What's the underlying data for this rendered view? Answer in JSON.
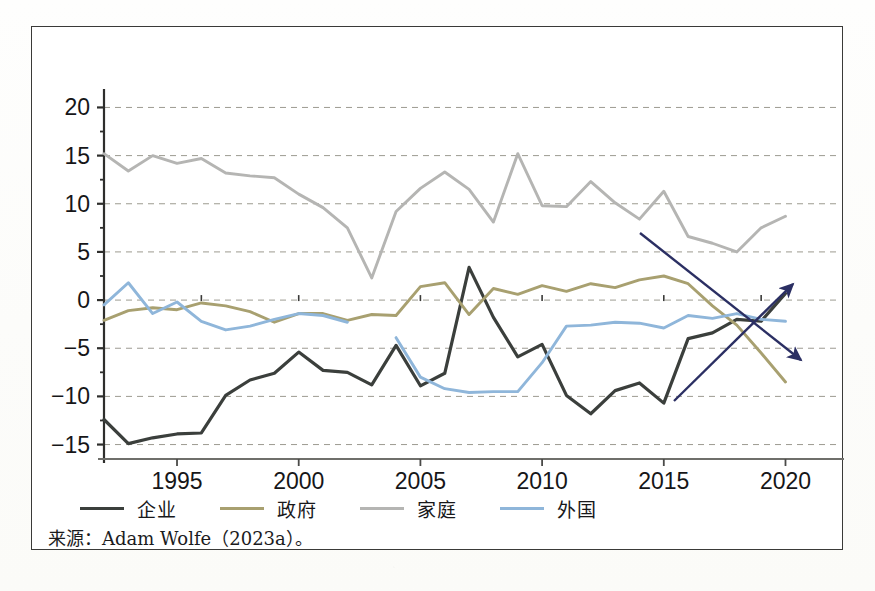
{
  "figure": {
    "source_note": "来源：Adam Wolfe（2023a）。",
    "frame_color": "#3a3a38",
    "background": "#ffffff"
  },
  "legend": {
    "position": "bottom-left",
    "items": [
      {
        "label": "企业",
        "color": "#3b3f3c",
        "name": "corporate"
      },
      {
        "label": "政府",
        "color": "#a8a070",
        "name": "government"
      },
      {
        "label": "家庭",
        "color": "#b5b5b3",
        "name": "household"
      },
      {
        "label": "外国",
        "color": "#8fb6da",
        "name": "foreign"
      }
    ]
  },
  "annotations": {
    "arrows": [
      {
        "name": "up-trend-arrow",
        "color": "#2b2f63",
        "x1": 673,
        "y1": 400,
        "x2": 792,
        "y2": 283
      },
      {
        "name": "down-trend-arrow",
        "color": "#2b2f63",
        "x1": 639,
        "y1": 232,
        "x2": 800,
        "y2": 359
      }
    ]
  },
  "chart_data": {
    "type": "line",
    "title": "",
    "xlabel": "",
    "ylabel": "",
    "xlim": [
      1992,
      2021.5
    ],
    "ylim": [
      -16.5,
      21.5
    ],
    "yticks": [
      -15,
      -10,
      -5,
      0,
      5,
      10,
      15,
      20
    ],
    "ytick_labels": [
      "-15",
      "-10",
      "-5",
      "0",
      "5",
      "10",
      "15",
      "20"
    ],
    "xticks": [
      1995,
      2000,
      2005,
      2010,
      2015,
      2020
    ],
    "xtick_labels": [
      "1995",
      "2000",
      "2005",
      "2010",
      "2015",
      "2020"
    ],
    "xminor_ticks": [
      1993,
      1994,
      1996,
      1997,
      1998,
      1999,
      2001,
      2002,
      2003,
      2004,
      2006,
      2007,
      2008,
      2009,
      2011,
      2012,
      2013,
      2014,
      2016,
      2017,
      2018,
      2019,
      2021
    ],
    "grid": "horizontal-dashed",
    "legend_position": "below-axes-left",
    "x": [
      1992,
      1993,
      1994,
      1995,
      1996,
      1997,
      1998,
      1999,
      2000,
      2001,
      2002,
      2003,
      2004,
      2005,
      2006,
      2007,
      2008,
      2009,
      2010,
      2011,
      2012,
      2013,
      2014,
      2015,
      2016,
      2017,
      2018,
      2019,
      2020
    ],
    "series": [
      {
        "name": "企业",
        "key": "corporate",
        "color": "#3b3f3c",
        "values": [
          -12.4,
          -14.9,
          -14.3,
          -13.9,
          -13.8,
          -9.9,
          -8.3,
          -7.6,
          -5.4,
          -7.3,
          -7.5,
          -8.8,
          -4.7,
          -8.9,
          -7.6,
          3.4,
          -1.8,
          -5.9,
          -4.6,
          -9.9,
          -11.8,
          -9.4,
          -8.6,
          -10.7,
          -4.0,
          -3.4,
          -2.0,
          -2.2,
          0.7
        ]
      },
      {
        "name": "政府",
        "key": "government",
        "color": "#a8a070",
        "values": [
          -2.1,
          -1.1,
          -0.8,
          -1.0,
          -0.3,
          -0.6,
          -1.2,
          -2.3,
          -1.4,
          -1.4,
          -2.1,
          -1.5,
          -1.6,
          1.4,
          1.8,
          -1.5,
          1.2,
          0.6,
          1.5,
          0.9,
          1.7,
          1.3,
          2.1,
          2.5,
          1.7,
          -0.6,
          -2.6,
          -5.5,
          -8.5
        ]
      },
      {
        "name": "家庭",
        "key": "household",
        "color": "#b5b5b3",
        "values": [
          15.2,
          13.4,
          15.0,
          14.2,
          14.7,
          13.2,
          12.9,
          12.7,
          11.0,
          9.6,
          7.5,
          2.3,
          9.2,
          11.6,
          13.3,
          11.5,
          8.1,
          15.2,
          9.8,
          9.7,
          12.3,
          10.1,
          8.4,
          11.3,
          6.6,
          5.9,
          5.0,
          7.5,
          8.7
        ]
      },
      {
        "name": "外国",
        "key": "foreign",
        "color": "#8fb6da",
        "values": [
          -0.5,
          1.8,
          -1.4,
          -0.2,
          -2.2,
          -3.1,
          -2.7,
          -2.0,
          -1.4,
          -1.6,
          -2.3,
          null,
          -3.9,
          -8.0,
          -9.2,
          -9.6,
          -9.5,
          -9.5,
          -6.5,
          -2.7,
          -2.6,
          -2.3,
          -2.4,
          -2.9,
          -1.6,
          -1.9,
          -1.4,
          -2.0,
          -2.2
        ]
      }
    ]
  }
}
